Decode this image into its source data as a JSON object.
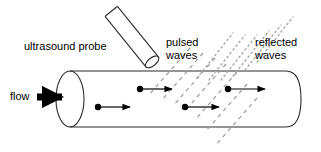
{
  "figure": {
    "background_color": "#ffffff",
    "line_color": "#000000",
    "wave_color": "#9a9a9a"
  },
  "labels": {
    "ultrasound_probe": "ultrasound probe",
    "flow": "flow",
    "pulsed_waves_line1": "pulsed",
    "pulsed_waves_line2": "waves",
    "reflected_waves_line1": "reflected",
    "reflected_waves_line2": "waves"
  },
  "shapes": {
    "pipe": {
      "name": "pipe-cylinder",
      "left_cap_center_x": 70,
      "left_cap_center_y": 99,
      "left_cap_rx": 14,
      "left_cap_ry": 28,
      "top_line_y": 71,
      "bottom_line_y": 127,
      "right_end_x": 300
    },
    "probe": {
      "name": "ultrasound-probe-body",
      "tip_x": 152,
      "tip_y": 62,
      "tail_x": 113,
      "tail_y": 13,
      "angle_deg": 51,
      "width": 16
    },
    "flow_arrow": {
      "name": "flow-arrow",
      "x1": 37,
      "y1": 97,
      "x2": 70,
      "y2": 97,
      "thickness": 7
    }
  },
  "particles": [
    {
      "name": "particle-1",
      "dot_x": 98,
      "dot_y": 107,
      "arrow_end_x": 133
    },
    {
      "name": "particle-2",
      "dot_x": 140,
      "dot_y": 89,
      "arrow_end_x": 175
    },
    {
      "name": "particle-3",
      "dot_x": 185,
      "dot_y": 107,
      "arrow_end_x": 222
    },
    {
      "name": "particle-4",
      "dot_x": 228,
      "dot_y": 89,
      "arrow_end_x": 268
    }
  ],
  "pulsed_wave_lines": [
    {
      "x1": 190,
      "y1": 48,
      "x2": 148,
      "y2": 96
    },
    {
      "x1": 202,
      "y1": 52,
      "x2": 160,
      "y2": 100
    },
    {
      "x1": 214,
      "y1": 56,
      "x2": 172,
      "y2": 104
    },
    {
      "x1": 226,
      "y1": 62,
      "x2": 184,
      "y2": 110
    },
    {
      "x1": 238,
      "y1": 70,
      "x2": 196,
      "y2": 118
    },
    {
      "x1": 248,
      "y1": 82,
      "x2": 206,
      "y2": 130
    },
    {
      "x1": 258,
      "y1": 96,
      "x2": 216,
      "y2": 144
    }
  ],
  "reflected_wave_lines": [
    {
      "x1": 196,
      "y1": 78,
      "x2": 232,
      "y2": 32
    },
    {
      "x1": 208,
      "y1": 80,
      "x2": 244,
      "y2": 34
    },
    {
      "x1": 220,
      "y1": 80,
      "x2": 256,
      "y2": 34
    },
    {
      "x1": 232,
      "y1": 76,
      "x2": 268,
      "y2": 30
    },
    {
      "x1": 244,
      "y1": 70,
      "x2": 280,
      "y2": 24
    },
    {
      "x1": 256,
      "y1": 62,
      "x2": 292,
      "y2": 16
    }
  ]
}
